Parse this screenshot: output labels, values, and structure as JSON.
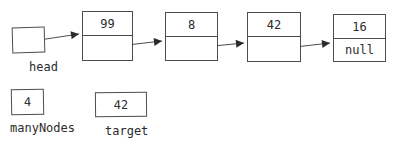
{
  "diagram": {
    "type": "linked-list",
    "head": {
      "label": "head"
    },
    "nodes": [
      {
        "value": "99"
      },
      {
        "value": "8"
      },
      {
        "value": "42"
      },
      {
        "value": "16",
        "next": "null"
      }
    ],
    "variables": [
      {
        "name": "manyNodes",
        "value": "4"
      },
      {
        "name": "target",
        "value": "42"
      }
    ],
    "colors": {
      "stroke": "#4d4d4d",
      "arrow": "#2b2b2b",
      "text": "#2b2b2b",
      "background": "#ffffff"
    }
  }
}
